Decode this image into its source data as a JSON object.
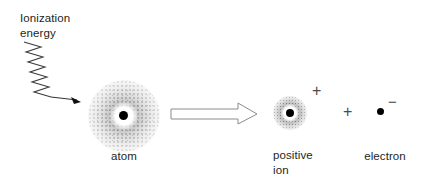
{
  "figure": {
    "background_color": "#ffffff",
    "ink_color": "#231f20",
    "labels": {
      "energy": "Ionization\nenergy",
      "atom": "atom",
      "positive_ion": "positive\nion",
      "electron": "electron"
    },
    "signs": {
      "ion_charge": "+",
      "plus_separator": "+",
      "electron_charge": "−"
    },
    "icons": {
      "photon": "zigzag-wave-arrow-icon",
      "reaction": "block-arrow-right-icon",
      "atom": "electron-cloud-icon",
      "ion": "electron-cloud-icon",
      "electron": "particle-dot-icon"
    }
  }
}
